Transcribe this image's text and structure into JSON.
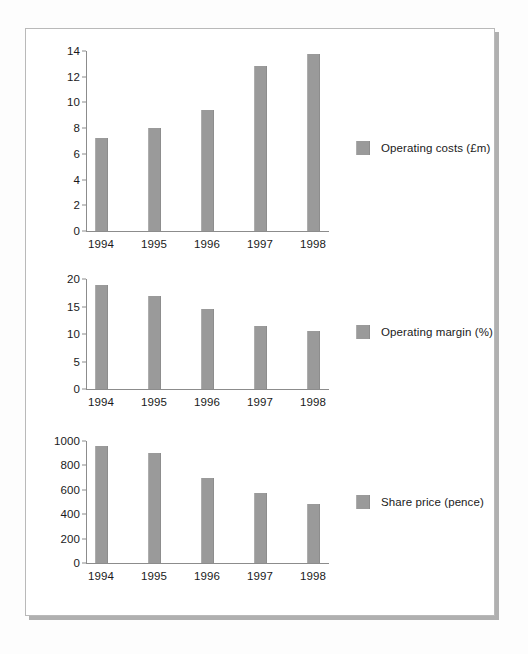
{
  "chart_data": [
    {
      "type": "bar",
      "title": "",
      "legend_label": "Operating costs (£m)",
      "xlabel": "",
      "ylabel": "",
      "categories": [
        "1994",
        "1995",
        "1996",
        "1997",
        "1998"
      ],
      "values": [
        7.2,
        8.0,
        9.4,
        12.8,
        13.8
      ],
      "yticks": [
        0,
        2,
        4,
        6,
        8,
        10,
        12,
        14
      ],
      "ytick_labels": [
        "0",
        "2",
        "4",
        "6",
        "8",
        "10",
        "12",
        "14"
      ],
      "ylim": [
        0,
        14
      ],
      "grid": false,
      "legend_position": "right",
      "bar_color": "#9a9a9a",
      "axis_color": "#8c8c8c"
    },
    {
      "type": "bar",
      "title": "",
      "legend_label": "Operating margin (%)",
      "xlabel": "",
      "ylabel": "",
      "categories": [
        "1994",
        "1995",
        "1996",
        "1997",
        "1998"
      ],
      "values": [
        19.0,
        17.0,
        14.5,
        11.5,
        10.5
      ],
      "yticks": [
        0,
        5,
        10,
        15,
        20
      ],
      "ytick_labels": [
        "0",
        "5",
        "10",
        "15",
        "20"
      ],
      "ylim": [
        0,
        20
      ],
      "grid": false,
      "legend_position": "right",
      "bar_color": "#9a9a9a",
      "axis_color": "#8c8c8c"
    },
    {
      "type": "bar",
      "title": "",
      "legend_label": "Share price (pence)",
      "xlabel": "",
      "ylabel": "",
      "categories": [
        "1994",
        "1995",
        "1996",
        "1997",
        "1998"
      ],
      "values": [
        960,
        900,
        700,
        575,
        480
      ],
      "yticks": [
        0,
        200,
        400,
        600,
        800,
        1000
      ],
      "ytick_labels": [
        "0",
        "200",
        "400",
        "600",
        "800",
        "1000"
      ],
      "ylim": [
        0,
        1000
      ],
      "grid": false,
      "legend_position": "right",
      "bar_color": "#9a9a9a",
      "axis_color": "#8c8c8c"
    }
  ]
}
